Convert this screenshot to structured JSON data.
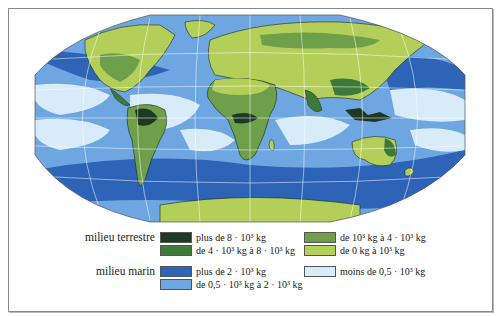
{
  "map": {
    "projection": "world-oval",
    "colors": {
      "terrestre_1": "#1f3a24",
      "terrestre_2": "#3f7a3a",
      "terrestre_3": "#6f9f4c",
      "terrestre_4": "#b4cf5a",
      "marin_1": "#2e64b8",
      "marin_2": "#6ea6e0",
      "marin_3": "#d7ecf8",
      "graticule": "#ffffff",
      "coast": "#1c2a1a"
    }
  },
  "legend": {
    "terrestre": {
      "title": "milieu terrestre",
      "items": [
        {
          "label": "plus de 8 · 10³ kg",
          "color": "#1f3a24"
        },
        {
          "label": "de 4 · 10³ kg à 8 · 10³ kg",
          "color": "#3f7a3a"
        },
        {
          "label": "de 10³ kg à 4 · 10³ kg",
          "color": "#6f9f4c"
        },
        {
          "label": "de 0 kg à 10³ kg",
          "color": "#b4cf5a"
        }
      ]
    },
    "marin": {
      "title": "milieu marin",
      "items": [
        {
          "label": "plus de 2 · 10³ kg",
          "color": "#2e64b8"
        },
        {
          "label": "de 0,5 · 10³ kg à 2 · 10³ kg",
          "color": "#6ea6e0"
        },
        {
          "label": "moins de 0,5 · 10³ kg",
          "color": "#d7ecf8"
        }
      ]
    }
  }
}
